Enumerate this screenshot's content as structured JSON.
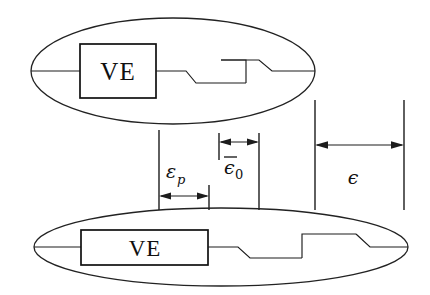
{
  "figure": {
    "name": "ve-element-strain-decomposition",
    "type": "schematic-diagram",
    "background_color": "#ffffff",
    "line_color": "#1c1c1c",
    "width": 430,
    "height": 295
  },
  "elements": {
    "top_body": {
      "name": "undeformed-configuration",
      "ve_box_label": "VE",
      "ellipse": {
        "cx": 173,
        "cy": 71,
        "rx": 142,
        "ry": 53
      },
      "box": {
        "x": 80,
        "y": 44,
        "w": 76,
        "h": 54
      }
    },
    "bottom_body": {
      "name": "deformed-configuration",
      "ve_box_label": "VE",
      "ellipse": {
        "cx": 221,
        "cy": 247,
        "rx": 187,
        "ry": 39
      },
      "box": {
        "x": 81,
        "y": 230,
        "w": 127,
        "h": 35
      }
    }
  },
  "dimensions": [
    {
      "id": "eps-p",
      "symbol": "ε",
      "subscript": "p",
      "overbar": false,
      "label_text": "εp",
      "description": "plastic strain",
      "x_start": 159,
      "x_end": 209,
      "arrow_y": 196,
      "label_x": 168,
      "label_y": 176
    },
    {
      "id": "eps-bar-0",
      "symbol": "ε",
      "subscript": "0",
      "overbar": true,
      "label_text": "ε̅0",
      "description": "reference strain",
      "x_start": 219,
      "x_end": 259,
      "arrow_y": 142,
      "label_x": 226,
      "label_y": 172
    },
    {
      "id": "eps-total",
      "symbol": "ε",
      "subscript": "",
      "overbar": false,
      "label_text": "ε",
      "description": "total strain",
      "x_start": 315,
      "x_end": 404,
      "arrow_y": 145,
      "label_x": 353,
      "label_y": 182
    }
  ],
  "extension_lines": [
    {
      "name": "ext-line-eps-p-left",
      "x": 159,
      "y1": 130,
      "y2": 210
    },
    {
      "name": "ext-line-eps-p-right",
      "x": 209,
      "y1": 185,
      "y2": 210
    },
    {
      "name": "ext-line-eps0-left",
      "x": 219,
      "y1": 133,
      "y2": 160
    },
    {
      "name": "ext-line-eps0-right",
      "x": 259,
      "y1": 133,
      "y2": 210
    },
    {
      "name": "ext-line-eps-left",
      "x": 315,
      "y1": 100,
      "y2": 210
    },
    {
      "name": "ext-line-eps-right",
      "x": 404,
      "y1": 100,
      "y2": 210
    }
  ]
}
